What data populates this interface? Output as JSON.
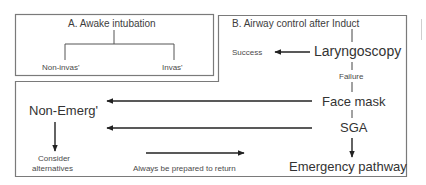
{
  "panel_a": {
    "title": "A. Awake intubation",
    "left_option": "Non-invas'",
    "right_option": "Invas'"
  },
  "panel_b": {
    "title": "B. Airway control after Induct",
    "steps": {
      "laryngoscopy": "Laryngoscopy",
      "face_mask": "Face mask",
      "sga": "SGA",
      "emergency": "Emergency pathway"
    },
    "success_label": "Success",
    "failure_label": "Failure",
    "non_emergency": "Non-Emerg'",
    "consider_line1": "Consider",
    "consider_line2": "alternatives",
    "return_note": "Always be prepared to return"
  },
  "colors": {
    "border": "#7a7a7a",
    "line": "#333333",
    "text": "#3a3a3a"
  }
}
